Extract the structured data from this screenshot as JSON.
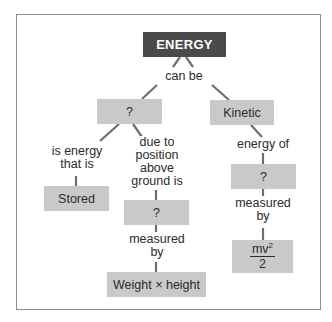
{
  "diagram": {
    "type": "concept-map",
    "nodes": {
      "root": "ENERGY",
      "left_unknown": "?",
      "kinetic": "Kinetic",
      "stored": "Stored",
      "middle_unknown": "?",
      "right_unknown": "?",
      "weight_height": "Weight × height",
      "kinetic_formula": {
        "numerator": "mv",
        "exponent": "2",
        "denominator": "2"
      }
    },
    "links": {
      "can_be": "can be",
      "is_energy_that_is": [
        "is energy",
        "that is"
      ],
      "due_to_position": [
        "due to",
        "position",
        "above",
        "ground is"
      ],
      "energy_of": "energy of",
      "measured_by_left": [
        "measured",
        "by"
      ],
      "measured_by_right": [
        "measured",
        "by"
      ]
    }
  },
  "colors": {
    "root_fill": "#4a4a4a",
    "node_fill": "#c9c9c9",
    "connector": "#6e6e6e",
    "frame": "#8c8c8c"
  }
}
